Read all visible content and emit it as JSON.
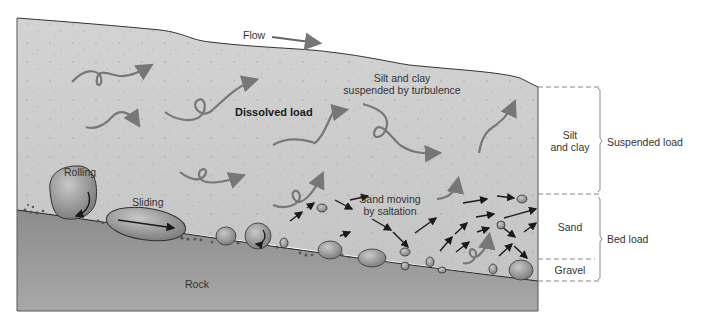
{
  "diagram": {
    "colors": {
      "water": "#cfcfcf",
      "rock": "#9a9a9a",
      "arrow_gray": "#777777",
      "arrow_black": "#1a1a1a",
      "outline": "#333333",
      "dash": "#888888"
    },
    "labels": {
      "flow": "Flow",
      "dissolved_load": "Dissolved load",
      "silt_clay_suspended_line1": "Silt and clay",
      "silt_clay_suspended_line2": "suspended by turbulence",
      "rolling": "Rolling",
      "sliding": "Sliding",
      "sand_saltation_line1": "Sand moving",
      "sand_saltation_line2": "by saltation",
      "rock": "Rock"
    },
    "legend": {
      "layers": [
        {
          "name": "Silt and clay",
          "line1": "Silt",
          "line2": "and clay"
        },
        {
          "name": "Sand",
          "line1": "Sand"
        },
        {
          "name": "Gravel",
          "line1": "Gravel"
        }
      ],
      "groups": [
        {
          "name": "Suspended load",
          "label": "Suspended load"
        },
        {
          "name": "Bed load",
          "label": "Bed load"
        }
      ]
    }
  }
}
